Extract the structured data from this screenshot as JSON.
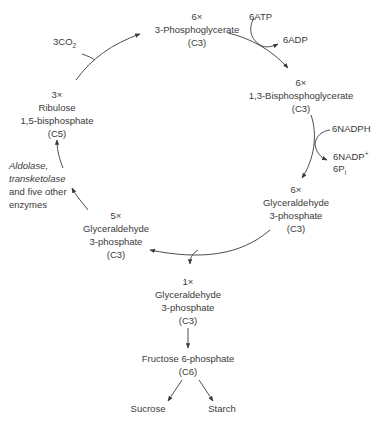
{
  "diagram": {
    "nodes": {
      "pga": {
        "count": "6×",
        "name": "3-Phosphoglycerate",
        "carbons": "(C3)"
      },
      "bpg": {
        "count": "6×",
        "name": "1,3-Bisphosphoglycerate",
        "carbons": "(C3)"
      },
      "g3p6": {
        "count": "6×",
        "name1": "Glyceraldehyde",
        "name2": "3-phosphate",
        "carbons": "(C3)"
      },
      "g3p5": {
        "count": "5×",
        "name1": "Glyceraldehyde",
        "name2": "3-phosphate",
        "carbons": "(C3)"
      },
      "rubp": {
        "count": "3×",
        "name1": "Ribulose",
        "name2": "1,5-bisphosphate",
        "carbons": "(C5)"
      },
      "g3p1": {
        "count": "1×",
        "name1": "Glyceraldehyde",
        "name2": "3-phosphate",
        "carbons": "(C3)"
      },
      "f6p": {
        "name": "Fructose 6-phosphate",
        "carbons": "(C6)"
      },
      "sucrose": {
        "name": "Sucrose"
      },
      "starch": {
        "name": "Starch"
      }
    },
    "cofactors": {
      "co2": {
        "main": "3CO",
        "sub": "2"
      },
      "atp": "6ATP",
      "adp": "6ADP",
      "nadph": "6NADPH",
      "nadp": {
        "main": "6NADP",
        "sup": "+"
      },
      "pi": {
        "main": "6P",
        "sub": "i"
      }
    },
    "enzymes": {
      "line1": "Aldolase,",
      "line2": "transketolase",
      "line3": "and five other",
      "line4": "enzymes"
    },
    "colors": {
      "text": "#3a3a3a",
      "line": "#3a3a3a",
      "background": "#ffffff"
    }
  }
}
